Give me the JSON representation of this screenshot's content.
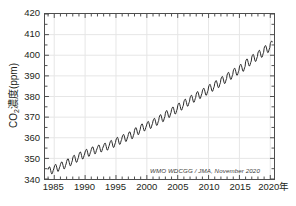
{
  "chart_data": {
    "type": "line",
    "title": "",
    "xlabel": "年",
    "ylabel": "CO2濃度(ppm)",
    "ylabel_main": "CO",
    "ylabel_sub": "2",
    "ylabel_rest": "濃度(ppm)",
    "xlim": [
      1983.5,
      2020.6
    ],
    "ylim": [
      340,
      420
    ],
    "grid": true,
    "legend": null,
    "annotation": "WMO WDCGG / JMA, November 2020",
    "line_color": "#2b2b2b",
    "axis_color": "#4d4d4d",
    "grid_color": "#e6e6e6",
    "yticks": [
      340,
      350,
      360,
      370,
      380,
      390,
      400,
      410,
      420
    ],
    "ytick_labels": [
      "340",
      "350",
      "360",
      "370",
      "380",
      "390",
      "400",
      "410",
      "420"
    ],
    "xticks": [
      1985,
      1990,
      1995,
      2000,
      2005,
      2010,
      2015,
      2020
    ],
    "xtick_labels": [
      "1985",
      "1990",
      "1995",
      "2000",
      "2005",
      "2010",
      "2015",
      "2020年"
    ],
    "y_minor_step": 5,
    "x_minor_step": 1,
    "series": [
      {
        "name": "Global mean CO2 monthly mean",
        "description": "Monthly global mean CO2 concentration with seasonal cycle",
        "x": [
          1984.0,
          1984.08,
          1984.17,
          1984.25,
          1984.33,
          1984.42,
          1984.5,
          1984.58,
          1984.67,
          1984.75,
          1984.83,
          1984.92,
          1985.0,
          1985.08,
          1985.17,
          1985.25,
          1985.33,
          1985.42,
          1985.5,
          1985.58,
          1985.67,
          1985.75,
          1985.83,
          1985.92,
          1986.0,
          1986.08,
          1986.17,
          1986.25,
          1986.33,
          1986.42,
          1986.5,
          1986.58,
          1986.67,
          1986.75,
          1986.83,
          1986.92,
          1987.0,
          1987.08,
          1987.17,
          1987.25,
          1987.33,
          1987.42,
          1987.5,
          1987.58,
          1987.67,
          1987.75,
          1987.83,
          1987.92,
          1988.0,
          1988.08,
          1988.17,
          1988.25,
          1988.33,
          1988.42,
          1988.5,
          1988.58,
          1988.67,
          1988.75,
          1988.83,
          1988.92,
          1989.0,
          1989.08,
          1989.17,
          1989.25,
          1989.33,
          1989.42,
          1989.5,
          1989.58,
          1989.67,
          1989.75,
          1989.83,
          1989.92,
          1990.0,
          1990.08,
          1990.17,
          1990.25,
          1990.33,
          1990.42,
          1990.5,
          1990.58,
          1990.67,
          1990.75,
          1990.83,
          1990.92,
          1991.0,
          1991.08,
          1991.17,
          1991.25,
          1991.33,
          1991.42,
          1991.5,
          1991.58,
          1991.67,
          1991.75,
          1991.83,
          1991.92,
          1992.0,
          1992.08,
          1992.17,
          1992.25,
          1992.33,
          1992.42,
          1992.5,
          1992.58,
          1992.67,
          1992.75,
          1992.83,
          1992.92,
          1993.0,
          1993.08,
          1993.17,
          1993.25,
          1993.33,
          1993.42,
          1993.5,
          1993.58,
          1993.67,
          1993.75,
          1993.83,
          1993.92,
          1994.0,
          1994.08,
          1994.17,
          1994.25,
          1994.33,
          1994.42,
          1994.5,
          1994.58,
          1994.67,
          1994.75,
          1994.83,
          1994.92,
          1995.0,
          1995.08,
          1995.17,
          1995.25,
          1995.33,
          1995.42,
          1995.5,
          1995.58,
          1995.67,
          1995.75,
          1995.83,
          1995.92,
          1996.0,
          1996.08,
          1996.17,
          1996.25,
          1996.33,
          1996.42,
          1996.5,
          1996.58,
          1996.67,
          1996.75,
          1996.83,
          1996.92,
          1997.0,
          1997.08,
          1997.17,
          1997.25,
          1997.33,
          1997.42,
          1997.5,
          1997.58,
          1997.67,
          1997.75,
          1997.83,
          1997.92,
          1998.0,
          1998.08,
          1998.17,
          1998.25,
          1998.33,
          1998.42,
          1998.5,
          1998.58,
          1998.67,
          1998.75,
          1998.83,
          1998.92,
          1999.0,
          1999.08,
          1999.17,
          1999.25,
          1999.33,
          1999.42,
          1999.5,
          1999.58,
          1999.67,
          1999.75,
          1999.83,
          1999.92,
          2000.0,
          2000.08,
          2000.17,
          2000.25,
          2000.33,
          2000.42,
          2000.5,
          2000.58,
          2000.67,
          2000.75,
          2000.83,
          2000.92,
          2001.0,
          2001.08,
          2001.17,
          2001.25,
          2001.33,
          2001.42,
          2001.5,
          2001.58,
          2001.67,
          2001.75,
          2001.83,
          2001.92,
          2002.0,
          2002.08,
          2002.17,
          2002.25,
          2002.33,
          2002.42,
          2002.5,
          2002.58,
          2002.67,
          2002.75,
          2002.83,
          2002.92,
          2003.0,
          2003.08,
          2003.17,
          2003.25,
          2003.33,
          2003.42,
          2003.5,
          2003.58,
          2003.67,
          2003.75,
          2003.83,
          2003.92,
          2004.0,
          2004.08,
          2004.17,
          2004.25,
          2004.33,
          2004.42,
          2004.5,
          2004.58,
          2004.67,
          2004.75,
          2004.83,
          2004.92,
          2005.0,
          2005.08,
          2005.17,
          2005.25,
          2005.33,
          2005.42,
          2005.5,
          2005.58,
          2005.67,
          2005.75,
          2005.83,
          2005.92,
          2006.0,
          2006.08,
          2006.17,
          2006.25,
          2006.33,
          2006.42,
          2006.5,
          2006.58,
          2006.67,
          2006.75,
          2006.83,
          2006.92,
          2007.0,
          2007.08,
          2007.17,
          2007.25,
          2007.33,
          2007.42,
          2007.5,
          2007.58,
          2007.67,
          2007.75,
          2007.83,
          2007.92,
          2008.0,
          2008.08,
          2008.17,
          2008.25,
          2008.33,
          2008.42,
          2008.5,
          2008.58,
          2008.67,
          2008.75,
          2008.83,
          2008.92,
          2009.0,
          2009.08,
          2009.17,
          2009.25,
          2009.33,
          2009.42,
          2009.5,
          2009.58,
          2009.67,
          2009.75,
          2009.83,
          2009.92,
          2010.0,
          2010.08,
          2010.17,
          2010.25,
          2010.33,
          2010.42,
          2010.5,
          2010.58,
          2010.67,
          2010.75,
          2010.83,
          2010.92,
          2011.0,
          2011.08,
          2011.17,
          2011.25,
          2011.33,
          2011.42,
          2011.5,
          2011.58,
          2011.67,
          2011.75,
          2011.83,
          2011.92,
          2012.0,
          2012.08,
          2012.17,
          2012.25,
          2012.33,
          2012.42,
          2012.5,
          2012.58,
          2012.67,
          2012.75,
          2012.83,
          2012.92,
          2013.0,
          2013.08,
          2013.17,
          2013.25,
          2013.33,
          2013.42,
          2013.5,
          2013.58,
          2013.67,
          2013.75,
          2013.83,
          2013.92,
          2014.0,
          2014.08,
          2014.17,
          2014.25,
          2014.33,
          2014.42,
          2014.5,
          2014.58,
          2014.67,
          2014.75,
          2014.83,
          2014.92,
          2015.0,
          2015.08,
          2015.17,
          2015.25,
          2015.33,
          2015.42,
          2015.5,
          2015.58,
          2015.67,
          2015.75,
          2015.83,
          2015.92,
          2016.0,
          2016.08,
          2016.17,
          2016.25,
          2016.33,
          2016.42,
          2016.5,
          2016.58,
          2016.67,
          2016.75,
          2016.83,
          2016.92,
          2017.0,
          2017.08,
          2017.17,
          2017.25,
          2017.33,
          2017.42,
          2017.5,
          2017.58,
          2017.67,
          2017.75,
          2017.83,
          2017.92,
          2018.0,
          2018.08,
          2018.17,
          2018.25,
          2018.33,
          2018.42,
          2018.5,
          2018.58,
          2018.67,
          2018.75,
          2018.83,
          2018.92,
          2019.0,
          2019.08,
          2019.17,
          2019.25,
          2019.33,
          2019.42,
          2019.5,
          2019.58,
          2019.67,
          2019.75,
          2019.83,
          2019.92,
          2020.0,
          2020.08,
          2020.17,
          2020.25,
          2020.33
        ],
        "values": [
          344.6,
          345.3,
          345.8,
          345.9,
          345.3,
          344.2,
          343.1,
          342.5,
          342.6,
          343.3,
          344.2,
          344.9,
          345.8,
          346.5,
          347.0,
          347.1,
          346.5,
          345.4,
          344.3,
          343.7,
          343.8,
          344.5,
          345.4,
          346.1,
          347.0,
          347.7,
          348.2,
          348.3,
          347.7,
          346.6,
          345.5,
          344.9,
          345.0,
          345.7,
          346.6,
          347.3,
          348.5,
          349.2,
          349.7,
          349.8,
          349.2,
          348.1,
          347.0,
          346.4,
          346.5,
          347.2,
          348.1,
          348.8,
          350.2,
          350.9,
          351.4,
          351.5,
          350.9,
          349.8,
          348.7,
          348.1,
          348.2,
          348.9,
          349.8,
          350.5,
          351.8,
          352.5,
          353.0,
          353.1,
          352.5,
          351.4,
          350.3,
          349.7,
          349.8,
          350.5,
          351.4,
          352.1,
          353.1,
          353.8,
          354.3,
          354.4,
          353.8,
          352.7,
          351.6,
          351.0,
          351.1,
          351.8,
          352.7,
          353.4,
          354.3,
          355.0,
          355.5,
          355.6,
          355.0,
          353.9,
          352.8,
          352.2,
          352.3,
          353.0,
          353.9,
          354.6,
          355.2,
          355.9,
          356.4,
          356.5,
          355.9,
          354.8,
          353.7,
          353.1,
          353.2,
          353.9,
          354.8,
          355.5,
          356.1,
          356.8,
          357.3,
          357.4,
          356.8,
          355.7,
          354.6,
          354.0,
          354.1,
          354.8,
          355.7,
          356.4,
          357.4,
          358.1,
          358.6,
          358.7,
          358.1,
          357.0,
          355.9,
          355.3,
          355.4,
          356.1,
          357.0,
          357.7,
          358.9,
          359.6,
          360.1,
          360.2,
          359.6,
          358.5,
          357.4,
          356.8,
          356.9,
          357.6,
          358.5,
          359.2,
          360.3,
          361.0,
          361.5,
          361.6,
          361.0,
          359.9,
          358.8,
          358.2,
          358.3,
          359.0,
          359.9,
          360.6,
          361.6,
          362.3,
          362.8,
          362.9,
          362.3,
          361.2,
          360.1,
          359.5,
          359.6,
          360.3,
          361.2,
          361.9,
          363.6,
          364.3,
          364.8,
          364.9,
          364.3,
          363.2,
          362.1,
          361.5,
          361.6,
          362.3,
          363.2,
          363.9,
          365.4,
          366.1,
          366.6,
          366.7,
          366.1,
          365.0,
          363.9,
          363.3,
          363.4,
          364.1,
          365.0,
          365.7,
          366.6,
          367.3,
          367.8,
          367.9,
          367.3,
          366.2,
          365.1,
          364.5,
          364.6,
          365.3,
          366.2,
          366.9,
          368.1,
          368.8,
          369.3,
          369.4,
          368.8,
          367.7,
          366.6,
          366.0,
          366.1,
          366.8,
          367.7,
          368.4,
          369.9,
          370.6,
          371.1,
          371.2,
          370.6,
          369.5,
          368.4,
          367.8,
          367.9,
          368.6,
          369.5,
          370.2,
          371.9,
          372.6,
          373.1,
          373.2,
          372.6,
          371.5,
          370.4,
          369.8,
          369.9,
          370.6,
          371.5,
          372.2,
          373.6,
          374.3,
          374.8,
          374.9,
          374.3,
          373.2,
          372.1,
          371.5,
          371.6,
          372.3,
          373.2,
          373.9,
          375.5,
          376.2,
          376.7,
          376.8,
          376.2,
          375.1,
          374.0,
          373.4,
          373.5,
          374.2,
          375.1,
          375.8,
          377.4,
          378.1,
          378.6,
          378.7,
          378.1,
          377.0,
          375.9,
          375.3,
          375.4,
          376.1,
          377.0,
          377.7,
          379.3,
          380.0,
          380.5,
          380.6,
          380.0,
          378.9,
          377.8,
          377.2,
          377.3,
          378.0,
          378.9,
          379.6,
          381.1,
          381.8,
          382.3,
          382.4,
          381.8,
          380.7,
          379.6,
          379.0,
          379.1,
          379.8,
          380.7,
          381.4,
          382.7,
          383.4,
          383.9,
          384.0,
          383.4,
          382.3,
          381.2,
          380.6,
          380.7,
          381.4,
          382.3,
          383.0,
          384.6,
          385.3,
          385.8,
          385.9,
          385.3,
          384.2,
          383.1,
          382.5,
          382.6,
          383.3,
          384.2,
          384.9,
          386.4,
          387.1,
          387.6,
          387.7,
          387.1,
          386.0,
          384.9,
          384.3,
          384.4,
          385.1,
          386.0,
          386.7,
          388.4,
          389.1,
          389.6,
          389.7,
          389.1,
          388.0,
          386.9,
          386.3,
          386.4,
          387.1,
          388.0,
          388.7,
          390.4,
          391.1,
          391.6,
          391.7,
          391.1,
          390.0,
          388.9,
          388.3,
          388.4,
          389.1,
          390.0,
          390.7,
          392.4,
          393.1,
          393.6,
          393.7,
          393.1,
          392.0,
          390.9,
          390.3,
          390.4,
          391.1,
          392.0,
          392.7,
          394.3,
          395.0,
          395.5,
          395.6,
          395.0,
          393.9,
          392.8,
          392.2,
          392.3,
          393.0,
          393.9,
          394.6,
          396.9,
          397.6,
          398.1,
          398.2,
          397.6,
          396.5,
          395.4,
          394.8,
          394.9,
          395.6,
          396.5,
          397.2,
          399.1,
          399.8,
          400.3,
          400.4,
          399.8,
          398.7,
          397.6,
          397.0,
          397.1,
          397.8,
          398.7,
          399.4,
          401.1,
          401.8,
          402.3,
          402.4,
          401.8,
          400.7,
          399.6,
          399.0,
          399.1,
          399.8,
          400.7,
          401.4,
          403.4,
          404.1,
          404.6,
          404.7,
          404.1,
          403.0,
          401.9,
          401.3,
          401.4,
          402.1,
          403.0,
          403.7,
          405.6,
          406.3,
          406.8,
          406.9,
          406.3
        ]
      }
    ]
  },
  "annotation_text": "WMO WDCGG / JMA, November 2020"
}
